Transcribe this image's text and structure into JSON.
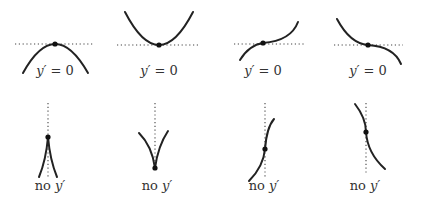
{
  "top_row": {
    "panels": [
      {
        "name": "local-maximum",
        "label_prefix": "y′",
        "label_suffix": " = 0"
      },
      {
        "name": "local-minimum",
        "label_prefix": "y′",
        "label_suffix": " = 0"
      },
      {
        "name": "increasing-inflection",
        "label_prefix": "y′",
        "label_suffix": " = 0"
      },
      {
        "name": "decreasing-inflection",
        "label_prefix": "y′",
        "label_suffix": " = 0"
      }
    ]
  },
  "bottom_row": {
    "panels": [
      {
        "name": "cusp-up",
        "label_prefix": "no ",
        "label_var": "y′"
      },
      {
        "name": "cusp-down",
        "label_prefix": "no ",
        "label_var": "y′"
      },
      {
        "name": "vertical-tangent-increasing",
        "label_prefix": "no ",
        "label_var": "y′"
      },
      {
        "name": "vertical-tangent-decreasing",
        "label_prefix": "no ",
        "label_var": "y′"
      }
    ]
  },
  "colors": {
    "curve": "#222222",
    "dotted": "#444444",
    "text": "#333333",
    "background": "#ffffff"
  }
}
